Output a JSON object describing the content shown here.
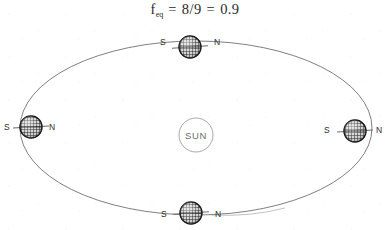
{
  "title": {
    "symbol": "f",
    "subscript": "eq",
    "equals_1": "=",
    "fraction": "8/9",
    "equals_2": "=",
    "value": "0.9",
    "full_text": "f_eq = 8/9 = 0.9"
  },
  "sun": {
    "label": "SUN",
    "cx": 196,
    "cy": 135,
    "r": 17,
    "stroke_color": "#9a9a9a"
  },
  "orbit": {
    "cx": 196,
    "cy": 128,
    "rx": 176,
    "ry": 87,
    "stroke_color": "#5e5e63",
    "stroke_width": 0.8,
    "label": "elliptical orbit path"
  },
  "planets": [
    {
      "id": "planet-top",
      "position": "top",
      "cx": 190,
      "cy": 47,
      "r": 11,
      "axis_tilt_deg": -4,
      "axis_length": 36,
      "south_label": "S",
      "north_label": "N",
      "south_label_x": 160,
      "south_label_y": 45,
      "north_label_x": 214,
      "north_label_y": 45
    },
    {
      "id": "planet-left",
      "position": "left",
      "cx": 31,
      "cy": 127,
      "r": 11,
      "axis_tilt_deg": -3,
      "axis_length": 36,
      "south_label": "S",
      "north_label": "N",
      "south_label_x": 4,
      "south_label_y": 130,
      "north_label_x": 49,
      "north_label_y": 130
    },
    {
      "id": "planet-right",
      "position": "right",
      "cx": 355,
      "cy": 131,
      "r": 11,
      "axis_tilt_deg": -3,
      "axis_length": 36,
      "south_label": "S",
      "north_label": "N",
      "south_label_x": 324,
      "south_label_y": 133,
      "north_label_x": 376,
      "north_label_y": 133
    },
    {
      "id": "planet-bottom",
      "position": "bottom",
      "cx": 191,
      "cy": 213,
      "r": 11,
      "axis_tilt_deg": -4,
      "axis_length": 36,
      "south_label": "S",
      "north_label": "N",
      "south_label_x": 161,
      "south_label_y": 217,
      "north_label_x": 215,
      "north_label_y": 217
    }
  ],
  "colors": {
    "background": "#ffffff",
    "ink": "#1b1b1b",
    "orbit_line": "#5e5e63",
    "sun_outline": "#9a9a9a",
    "planet_fill": "#d8d8d8",
    "planet_grid": "#1a1a1a",
    "axis_line": "#6a6a70"
  }
}
